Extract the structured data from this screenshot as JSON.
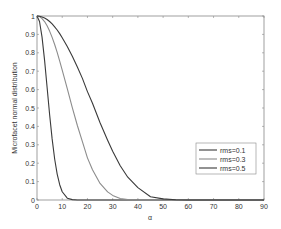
{
  "chart_data": {
    "type": "line",
    "title": "",
    "xlabel": "α",
    "ylabel": "Microfacet normal distribution",
    "xlim": [
      0,
      90
    ],
    "ylim": [
      0,
      1
    ],
    "xticks": [
      "0",
      "10",
      "20",
      "30",
      "40",
      "50",
      "60",
      "70",
      "80",
      "90"
    ],
    "yticks": [
      "0",
      "0.1",
      "0.2",
      "0.3",
      "0.4",
      "0.5",
      "0.6",
      "0.7",
      "0.8",
      "0.9",
      "1"
    ],
    "grid": false,
    "legend_position": "lower right (inside)",
    "x": [
      0,
      1,
      2,
      3,
      4,
      5,
      6,
      7,
      8,
      9,
      10,
      12,
      14,
      16,
      18,
      20,
      22,
      25,
      28,
      30,
      33,
      36,
      40,
      45,
      50,
      55,
      60,
      65,
      70,
      75,
      80,
      85,
      90
    ],
    "series": [
      {
        "name": "rms=0.1",
        "color": "#3a3a3a",
        "values": [
          1.0,
          0.97,
          0.885,
          0.76,
          0.613,
          0.465,
          0.332,
          0.223,
          0.141,
          0.083,
          0.045,
          0.01,
          0.002,
          0.0,
          0.0,
          0.0,
          0.0,
          0.0,
          0.0,
          0.0,
          0.0,
          0.0,
          0.0,
          0.0,
          0.0,
          0.0,
          0.0,
          0.0,
          0.0,
          0.0,
          0.0,
          0.0,
          0.0
        ]
      },
      {
        "name": "rms=0.3",
        "color": "#8c8c8c",
        "values": [
          1.0,
          0.997,
          0.986,
          0.97,
          0.947,
          0.918,
          0.884,
          0.845,
          0.802,
          0.755,
          0.706,
          0.605,
          0.502,
          0.405,
          0.317,
          0.229,
          0.164,
          0.09,
          0.044,
          0.025,
          0.008,
          0.002,
          0.0,
          0.0,
          0.0,
          0.0,
          0.0,
          0.0,
          0.0,
          0.0,
          0.0,
          0.0,
          0.0
        ]
      },
      {
        "name": "rms=0.5",
        "color": "#3a3a3a",
        "values": [
          1.0,
          0.999,
          0.995,
          0.989,
          0.981,
          0.97,
          0.957,
          0.941,
          0.924,
          0.904,
          0.882,
          0.834,
          0.781,
          0.723,
          0.661,
          0.589,
          0.526,
          0.42,
          0.325,
          0.265,
          0.186,
          0.124,
          0.067,
          0.018,
          0.006,
          0.001,
          0.0,
          0.0,
          0.0,
          0.0,
          0.0,
          0.0,
          0.0
        ]
      }
    ],
    "legend": [
      "rms=0.1",
      "rms=0.3",
      "rms=0.5"
    ]
  },
  "axes": {
    "xlabel": "α",
    "ylabel": "Microfacet normal distribution"
  }
}
